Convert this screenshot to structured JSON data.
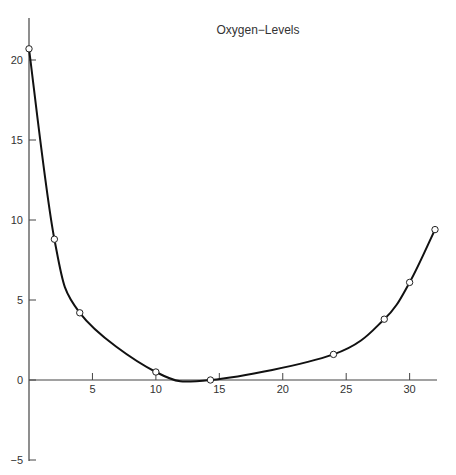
{
  "chart_data": {
    "type": "line",
    "title": "Oxygen−Levels",
    "xlabel": "",
    "ylabel": "",
    "xlim": [
      0,
      32
    ],
    "ylim": [
      -5,
      22.5
    ],
    "xticks": [
      5,
      10,
      15,
      20,
      25,
      30
    ],
    "xtick_labels": [
      "5",
      "10",
      "15",
      "20",
      "25",
      "30"
    ],
    "yticks": [
      -5,
      0,
      5,
      10,
      15,
      20
    ],
    "ytick_labels": [
      "−5",
      "0",
      "5",
      "10",
      "15",
      "20"
    ],
    "grid": false,
    "legend": "none",
    "series": [
      {
        "name": "Oxygen-Levels",
        "color": "#111111",
        "marker": "open-circle",
        "points": [
          {
            "x": 0,
            "y": 20.7
          },
          {
            "x": 2,
            "y": 8.8
          },
          {
            "x": 4,
            "y": 4.2
          },
          {
            "x": 10,
            "y": 0.5
          },
          {
            "x": 14.3,
            "y": 0.0
          },
          {
            "x": 24,
            "y": 1.6
          },
          {
            "x": 28,
            "y": 3.8
          },
          {
            "x": 30,
            "y": 6.1
          },
          {
            "x": 32,
            "y": 9.4
          }
        ]
      }
    ]
  }
}
